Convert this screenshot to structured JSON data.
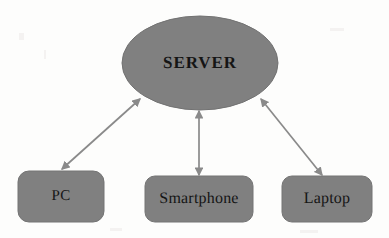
{
  "diagram": {
    "type": "hub-and-spoke network topology",
    "background_color": "#fdfdfc",
    "node_fill_color": "#808080",
    "node_stroke_color": "#6e6e6e",
    "edge_color": "#8a8a8a",
    "text_color": "#151515",
    "nodes": [
      {
        "id": "server",
        "label": "SERVER",
        "shape": "ellipse",
        "role": "hub",
        "cx": 200,
        "cy": 63,
        "rx": 78,
        "ry": 47
      },
      {
        "id": "pc",
        "label": "PC",
        "shape": "rounded-rectangle",
        "role": "client",
        "x": 18,
        "y": 171,
        "width": 86,
        "height": 51
      },
      {
        "id": "smartphone",
        "label": "Smartphone",
        "shape": "rounded-rectangle",
        "role": "client",
        "x": 145,
        "y": 176,
        "width": 108,
        "height": 46
      },
      {
        "id": "laptop",
        "label": "Laptop",
        "shape": "rounded-rectangle",
        "role": "client",
        "x": 282,
        "y": 176,
        "width": 90,
        "height": 46
      }
    ],
    "edges": [
      {
        "id": "edge-pc-server",
        "from": "pc",
        "to": "server",
        "style": "double-headed-arrow",
        "label": ""
      },
      {
        "id": "edge-smartphone-server",
        "from": "smartphone",
        "to": "server",
        "style": "double-headed-arrow",
        "label": ""
      },
      {
        "id": "edge-laptop-server",
        "from": "laptop",
        "to": "server",
        "style": "double-headed-arrow",
        "label": ""
      }
    ]
  }
}
